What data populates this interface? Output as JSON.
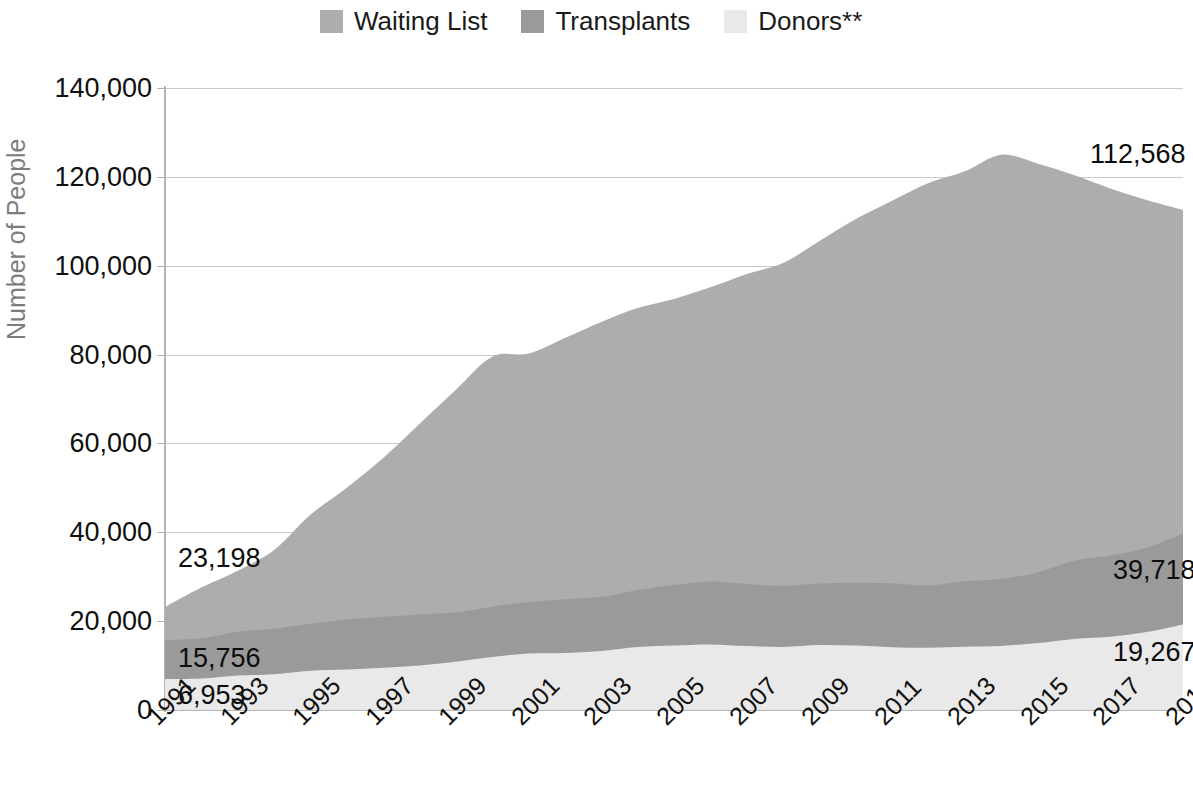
{
  "legend": {
    "items": [
      {
        "label": "Waiting List",
        "color": "#adadad",
        "icon": "legend-swatch-icon"
      },
      {
        "label": "Transplants",
        "color": "#9a9a9a",
        "icon": "legend-swatch-icon"
      },
      {
        "label": "Donors**",
        "color": "#e9e9e9",
        "icon": "legend-swatch-icon"
      }
    ]
  },
  "axes": {
    "y_title": "Number of People",
    "y_ticks": [
      "140,000",
      "120,000",
      "100,000",
      "80,000",
      "60,000",
      "40,000",
      "20,000",
      "0"
    ],
    "x_ticks": [
      "1991",
      "1993",
      "1995",
      "1997",
      "1999",
      "2001",
      "2003",
      "2005",
      "2007",
      "2009",
      "2011",
      "2013",
      "2015",
      "2017",
      "2019"
    ]
  },
  "annotations": {
    "left_waiting_list": "23,198",
    "left_transplants": "15,756",
    "left_donors": "6,953",
    "right_waiting_list": "112,568",
    "right_transplants": "39,718",
    "right_donors": "19,267"
  },
  "chart_data": {
    "type": "area",
    "stacked": false,
    "title": "",
    "xlabel": "",
    "ylabel": "Number of People",
    "ylim": [
      0,
      140000
    ],
    "yticks": [
      0,
      20000,
      40000,
      60000,
      80000,
      100000,
      120000,
      140000
    ],
    "grid": true,
    "legend_position": "top",
    "x": [
      1991,
      1992,
      1993,
      1994,
      1995,
      1996,
      1997,
      1998,
      1999,
      2000,
      2001,
      2002,
      2003,
      2004,
      2005,
      2006,
      2007,
      2008,
      2009,
      2010,
      2011,
      2012,
      2013,
      2014,
      2015,
      2016,
      2017,
      2018,
      2019
    ],
    "series": [
      {
        "name": "Waiting List",
        "color": "#adadad",
        "values": [
          23198,
          27563,
          31355,
          36013,
          43937,
          50046,
          56716,
          64423,
          72110,
          79523,
          80238,
          83752,
          87343,
          90487,
          92534,
          95150,
          98158,
          100597,
          105567,
          110521,
          114640,
          118617,
          121272,
          125000,
          123000,
          120400,
          117400,
          114800,
          112568
        ]
      },
      {
        "name": "Transplants",
        "color": "#9a9a9a",
        "values": [
          15756,
          16134,
          17639,
          18298,
          19396,
          20360,
          20961,
          21520,
          21998,
          23257,
          24239,
          24906,
          25470,
          27036,
          28117,
          28931,
          28358,
          27963,
          28464,
          28664,
          28538,
          28052,
          28953,
          29532,
          30974,
          33612,
          34771,
          36529,
          39718
        ]
      },
      {
        "name": "Donors**",
        "color": "#e9e9e9",
        "values": [
          6953,
          7091,
          7780,
          8027,
          8851,
          9103,
          9536,
          10009,
          10860,
          11928,
          12697,
          12820,
          13283,
          14152,
          14491,
          14755,
          14399,
          14208,
          14631,
          14506,
          14145,
          14013,
          14257,
          14414,
          15064,
          16000,
          16475,
          17553,
          19267
        ]
      }
    ],
    "notes": {
      "peak_waiting_list_year": 2014,
      "peak_waiting_list_value": 125000
    }
  }
}
